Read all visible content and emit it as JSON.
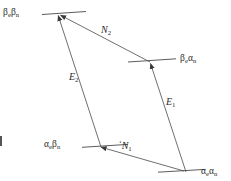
{
  "figure": {
    "kind": "energy-level-diagram",
    "width": 231,
    "height": 181,
    "background_color": "#ffffff",
    "line_color": "#4a4a4a",
    "text_color": "#2b2b2b"
  },
  "states": [
    {
      "id": "beta-e-beta-n",
      "label_greek": "β",
      "label_sub1": "e",
      "label_greek2": "β",
      "label_sub2": "n",
      "label_plain": "βeβn",
      "position": "top-left",
      "level_x1": 42,
      "level_x2": 86,
      "level_y1": 14,
      "level_y2": 12,
      "label_x": 3,
      "label_y": 9
    },
    {
      "id": "beta-e-alpha-n",
      "label_greek": "β",
      "label_sub1": "e",
      "label_greek2": "α",
      "label_sub2": "n",
      "label_plain": "βeαn",
      "position": "middle-right",
      "level_x1": 128,
      "level_x2": 176,
      "level_y1": 62,
      "level_y2": 59,
      "label_x": 179,
      "label_y": 55
    },
    {
      "id": "alpha-e-beta-n",
      "label_greek": "α",
      "label_sub1": "e",
      "label_greek2": "β",
      "label_sub2": "n",
      "label_plain": "αeβn",
      "position": "lower-left",
      "level_x1": 82,
      "level_x2": 128,
      "level_y1": 147,
      "level_y2": 145,
      "label_x": 44,
      "label_y": 141
    },
    {
      "id": "alpha-e-alpha-n",
      "label_greek": "α",
      "label_sub1": "e",
      "label_greek2": "α",
      "label_sub2": "n",
      "label_plain": "αeαn",
      "position": "bottom-right",
      "level_x1": 158,
      "level_x2": 205,
      "level_y1": 172,
      "level_y2": 170,
      "label_x": 202,
      "label_y": 168
    }
  ],
  "transitions": [
    {
      "id": "N2",
      "symbol": "N",
      "subscript": "2",
      "prime": "",
      "label_plain": "N2",
      "type": "nuclear",
      "from_state": "beta-e-alpha-n",
      "to_state": "beta-e-beta-n",
      "x1": 150,
      "y1": 62,
      "x2": 60,
      "y2": 15,
      "label_x": 101,
      "label_y": 29
    },
    {
      "id": "E2",
      "symbol": "E",
      "subscript": "2",
      "prime": "",
      "label_plain": "E2",
      "type": "electron",
      "from_state": "alpha-e-beta-n",
      "to_state": "beta-e-beta-n",
      "x1": 101,
      "y1": 147,
      "x2": 58,
      "y2": 15,
      "label_x": 69,
      "label_y": 76
    },
    {
      "id": "E1",
      "symbol": "E",
      "subscript": "1",
      "prime": "",
      "label_plain": "E1",
      "type": "electron",
      "from_state": "alpha-e-alpha-n",
      "to_state": "beta-e-alpha-n",
      "x1": 186,
      "y1": 172,
      "x2": 150,
      "y2": 63,
      "label_x": 165,
      "label_y": 101
    },
    {
      "id": "N1",
      "symbol": "N",
      "subscript": "1",
      "prime": "‘",
      "label_plain": "‘N1",
      "type": "nuclear",
      "from_state": "alpha-e-alpha-n",
      "to_state": "alpha-e-beta-n",
      "x1": 184,
      "y1": 171,
      "x2": 100,
      "y2": 147,
      "label_x": 120,
      "label_y": 145
    }
  ]
}
